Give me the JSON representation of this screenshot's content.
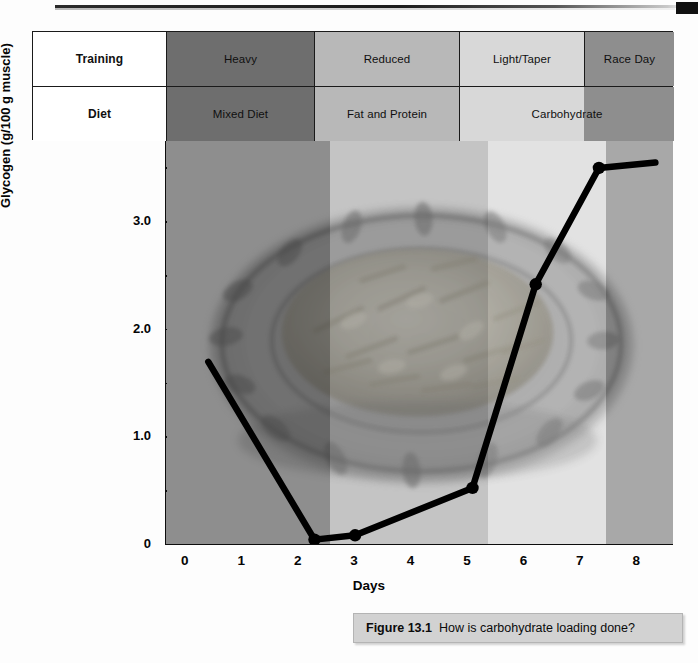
{
  "figure": {
    "caption_number": "Figure 13.1",
    "caption_text": "How is carbohydrate loading done?"
  },
  "phase_table": {
    "rows": [
      {
        "header": "Training",
        "cells": [
          {
            "label": "Heavy",
            "color": "#6e6e6e"
          },
          {
            "label": "Reduced",
            "color": "#b8b8b8"
          },
          {
            "label": "Light/Taper",
            "color": "#d8d8d8"
          },
          {
            "label": "Race Day",
            "color": "#8e8e8e"
          }
        ]
      },
      {
        "header": "Diet",
        "cells": [
          {
            "label": "Mixed Diet",
            "color": "#6e6e6e"
          },
          {
            "label": "Fat and Protein",
            "color": "#b8b8b8"
          },
          {
            "label": "Carbohydrate",
            "color": "#d8d8d8"
          }
        ]
      }
    ]
  },
  "chart_data": {
    "type": "line",
    "title": "",
    "xlabel": "Days",
    "ylabel": "Glycogen (g/100 g muscle)",
    "xlim": [
      -0.35,
      8.65
    ],
    "ylim": [
      0,
      3.75
    ],
    "grid": false,
    "legend_position": "none",
    "x_ticks": [
      0,
      1,
      2,
      3,
      4,
      5,
      6,
      7,
      8
    ],
    "x_tick_labels": [
      "0",
      "1",
      "2",
      "3",
      "4",
      "5",
      "6",
      "7",
      "8"
    ],
    "y_ticks": [
      0,
      1.0,
      2.0,
      3.0
    ],
    "y_tick_labels": [
      "0",
      "1.0",
      "2.0",
      "3.0"
    ],
    "y_minor_ticks": [
      0.5,
      1.5,
      2.5,
      3.5
    ],
    "series": [
      {
        "name": "Muscle glycogen",
        "color": "#000000",
        "x": [
          0.4,
          2.28,
          3.0,
          5.08,
          6.2,
          7.32,
          8.32
        ],
        "y": [
          1.7,
          0.05,
          0.09,
          0.53,
          2.42,
          3.5,
          3.55
        ],
        "markers": [
          false,
          true,
          true,
          true,
          true,
          true,
          false
        ]
      }
    ],
    "background_bands": [
      {
        "from": -0.35,
        "to": 2.55,
        "color": "#8e8e8e",
        "phase": "Heavy / Mixed Diet"
      },
      {
        "from": 2.55,
        "to": 5.35,
        "color": "#c4c4c4",
        "phase": "Reduced / Fat and Protein"
      },
      {
        "from": 5.35,
        "to": 7.45,
        "color": "#e2e2e2",
        "phase": "Light-Taper / Carbohydrate"
      },
      {
        "from": 7.45,
        "to": 8.65,
        "color": "#a8a8a8",
        "phase": "Race Day / Carbohydrate"
      }
    ]
  }
}
